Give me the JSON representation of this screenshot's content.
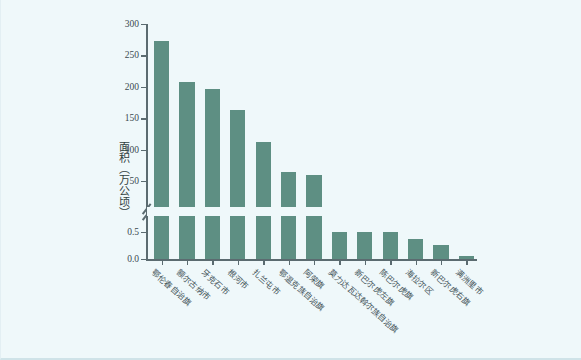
{
  "figure": {
    "background_color": "#eff8fa",
    "bar_color": "#5e8f83",
    "axis_color": "#5b6b70"
  },
  "chart_data": {
    "type": "bar",
    "title": "",
    "xlabel": "",
    "ylabel": "面积（万公顷）",
    "grid": false,
    "legend": null,
    "axis_break": {
      "present": true,
      "lower_range": [
        0.0,
        0.5
      ],
      "upper_range": [
        50,
        300
      ]
    },
    "ytick_labels_upper": [
      "300",
      "250",
      "200",
      "150",
      "100",
      "50"
    ],
    "ytick_values_upper": [
      300,
      250,
      200,
      150,
      100,
      50
    ],
    "ytick_labels_lower": [
      "0.5",
      "0.0"
    ],
    "ytick_values_lower": [
      0.5,
      0.0
    ],
    "categories": [
      "鄂伦春自治旗",
      "额尔古纳市",
      "牙克石市",
      "根河市",
      "扎兰屯市",
      "鄂温克族自治旗",
      "阿荣旗",
      "莫力达瓦达斡尔族自治旗",
      "新巴尔虎左旗",
      "陈巴尔虎旗",
      "海拉尔区",
      "新巴尔虎右旗",
      "满洲里市"
    ],
    "values": [
      273,
      208,
      197,
      163,
      112,
      65,
      59,
      30,
      27,
      25,
      0.37,
      0.26,
      0.05
    ]
  }
}
